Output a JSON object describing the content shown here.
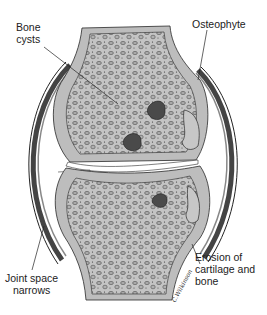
{
  "figure": {
    "colors": {
      "background": "#ffffff",
      "bone_fill": "#bdbdbd",
      "trabecula_fill": "#a8a8a8",
      "ink": "#2a2a2a",
      "lesion": "#4a4a4a",
      "capsule": "#555555",
      "joint_space": "#ffffff"
    }
  },
  "labels": {
    "bone_cysts": {
      "line1": "Bone",
      "line2": "cysts"
    },
    "osteophyte": {
      "line1": "Osteophyte"
    },
    "joint_space": {
      "line1": "Joint space",
      "line2": "narrows"
    },
    "erosion": {
      "line1": "Erosion of",
      "line2": "cartilage and",
      "line3": "bone"
    }
  },
  "signature": {
    "text": "C.Wilkinson"
  }
}
